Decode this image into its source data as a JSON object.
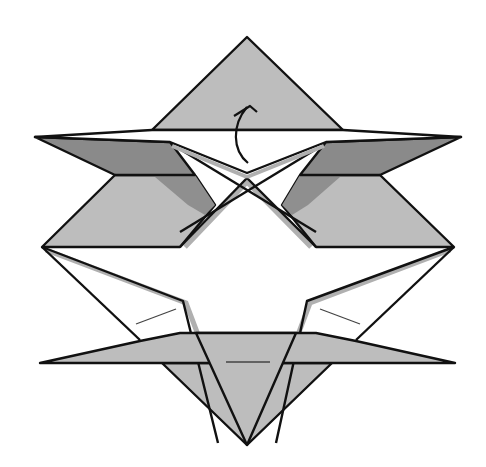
{
  "diagram": {
    "type": "origami-folding-step",
    "colors": {
      "background": "#ffffff",
      "paper_light": "#bdbdbd",
      "paper_dark": "#8a8a8a",
      "paper_white": "#ffffff",
      "shadow": "#a9a9a9",
      "line": "#111111",
      "crease": "#444444"
    },
    "annotations": [
      {
        "id": "fold-up-arrow",
        "kind": "curved-arrow",
        "direction": "up"
      }
    ]
  }
}
